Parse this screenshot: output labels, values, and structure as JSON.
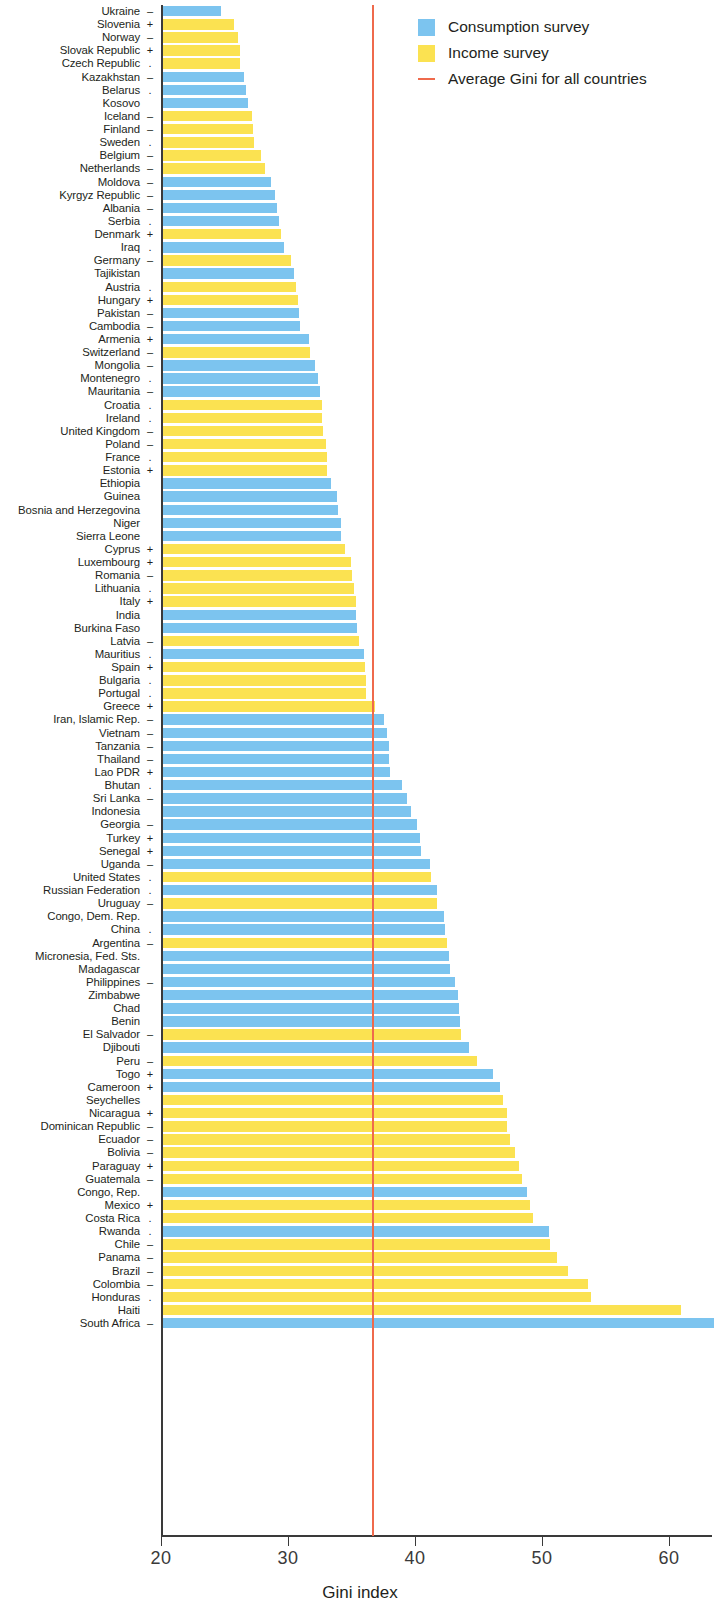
{
  "chart_data": {
    "type": "bar",
    "orientation": "horizontal",
    "title": "",
    "xlabel": "Gini index",
    "ylabel": "",
    "xlim": [
      20,
      64
    ],
    "xticks": [
      20,
      30,
      40,
      50,
      60
    ],
    "grid": false,
    "legend_position": "top-right",
    "legend": [
      {
        "label": "Consumption survey",
        "color": "#7cc4ef",
        "marker": "square"
      },
      {
        "label": "Income survey",
        "color": "#fbe251",
        "marker": "square"
      },
      {
        "label": "Average Gini for all countries",
        "color": "#ef6a4c",
        "marker": "line"
      }
    ],
    "annotations": {
      "average_gini_all_countries": 36.6,
      "average_line_color": "#ef6a4c",
      "trend_symbol_meaning": {
        "+": "increasing",
        "–": "decreasing",
        ".": "no significant trend",
        "": "not available"
      }
    },
    "categories": [
      "Ukraine",
      "Slovenia",
      "Norway",
      "Slovak Republic",
      "Czech Republic",
      "Kazakhstan",
      "Belarus",
      "Kosovo",
      "Iceland",
      "Finland",
      "Sweden",
      "Belgium",
      "Netherlands",
      "Moldova",
      "Kyrgyz Republic",
      "Albania",
      "Serbia",
      "Denmark",
      "Iraq",
      "Germany",
      "Tajikistan",
      "Austria",
      "Hungary",
      "Pakistan",
      "Cambodia",
      "Armenia",
      "Switzerland",
      "Mongolia",
      "Montenegro",
      "Mauritania",
      "Croatia",
      "Ireland",
      "United Kingdom",
      "Poland",
      "France",
      "Estonia",
      "Ethiopia",
      "Guinea",
      "Bosnia and Herzegovina",
      "Niger",
      "Sierra Leone",
      "Cyprus",
      "Luxembourg",
      "Romania",
      "Lithuania",
      "Italy",
      "India",
      "Burkina Faso",
      "Latvia",
      "Mauritius",
      "Spain",
      "Bulgaria",
      "Portugal",
      "Greece",
      "Iran, Islamic Rep.",
      "Vietnam",
      "Tanzania",
      "Thailand",
      "Lao PDR",
      "Bhutan",
      "Sri Lanka",
      "Indonesia",
      "Georgia",
      "Turkey",
      "Senegal",
      "Uganda",
      "United States",
      "Russian Federation",
      "Uruguay",
      "Congo, Dem. Rep.",
      "China",
      "Argentina",
      "Micronesia, Fed. Sts.",
      "Madagascar",
      "Philippines",
      "Zimbabwe",
      "Chad",
      "Benin",
      "El Salvador",
      "Djibouti",
      "Peru",
      "Togo",
      "Cameroon",
      "Seychelles",
      "Nicaragua",
      "Dominican Republic",
      "Ecuador",
      "Bolivia",
      "Paraguay",
      "Guatemala",
      "Congo, Rep.",
      "Mexico",
      "Costa Rica",
      "Rwanda",
      "Chile",
      "Panama",
      "Brazil",
      "Colombia",
      "Honduras",
      "Haiti",
      "South Africa"
    ],
    "values": [
      24.6,
      25.6,
      25.9,
      26.1,
      26.1,
      26.4,
      26.5,
      26.7,
      27.0,
      27.1,
      27.2,
      27.7,
      28.0,
      28.5,
      28.8,
      29.0,
      29.1,
      29.3,
      29.5,
      30.1,
      30.3,
      30.5,
      30.6,
      30.7,
      30.8,
      31.5,
      31.6,
      32.0,
      32.2,
      32.4,
      32.5,
      32.5,
      32.6,
      32.8,
      32.9,
      32.9,
      33.2,
      33.7,
      33.8,
      34.0,
      34.0,
      34.3,
      34.8,
      34.9,
      35.0,
      35.2,
      35.2,
      35.3,
      35.4,
      35.8,
      35.9,
      36.0,
      36.0,
      36.7,
      37.4,
      37.6,
      37.8,
      37.8,
      37.9,
      38.8,
      39.2,
      39.5,
      40.0,
      40.2,
      40.3,
      41.0,
      41.1,
      41.6,
      41.6,
      42.1,
      42.2,
      42.4,
      42.5,
      42.6,
      43.0,
      43.2,
      43.3,
      43.4,
      43.5,
      44.1,
      44.7,
      46.0,
      46.5,
      46.8,
      47.1,
      47.1,
      47.3,
      47.7,
      48.0,
      48.3,
      48.7,
      48.9,
      49.1,
      50.4,
      50.5,
      51.0,
      51.9,
      53.5,
      53.7,
      60.8,
      63.4
    ],
    "bar_types": [
      "consumption",
      "income",
      "income",
      "income",
      "income",
      "consumption",
      "consumption",
      "consumption",
      "income",
      "income",
      "income",
      "income",
      "income",
      "consumption",
      "consumption",
      "consumption",
      "consumption",
      "income",
      "consumption",
      "income",
      "consumption",
      "income",
      "income",
      "consumption",
      "consumption",
      "consumption",
      "income",
      "consumption",
      "consumption",
      "consumption",
      "income",
      "income",
      "income",
      "income",
      "income",
      "income",
      "consumption",
      "consumption",
      "consumption",
      "consumption",
      "consumption",
      "income",
      "income",
      "income",
      "income",
      "income",
      "consumption",
      "consumption",
      "income",
      "consumption",
      "income",
      "income",
      "income",
      "income",
      "consumption",
      "consumption",
      "consumption",
      "consumption",
      "consumption",
      "consumption",
      "consumption",
      "consumption",
      "consumption",
      "consumption",
      "consumption",
      "consumption",
      "income",
      "consumption",
      "income",
      "consumption",
      "consumption",
      "income",
      "consumption",
      "consumption",
      "consumption",
      "consumption",
      "consumption",
      "consumption",
      "income",
      "consumption",
      "income",
      "consumption",
      "consumption",
      "income",
      "income",
      "income",
      "income",
      "income",
      "income",
      "income",
      "consumption",
      "income",
      "income",
      "consumption",
      "income",
      "income",
      "income",
      "income",
      "income",
      "income",
      "consumption"
    ],
    "trend_symbols": [
      "–",
      "+",
      "–",
      "+",
      ".",
      "–",
      ".",
      "",
      "–",
      "–",
      ".",
      "–",
      "–",
      "–",
      "–",
      "–",
      ".",
      "+",
      ".",
      "–",
      "",
      ".",
      "+",
      "–",
      "–",
      "+",
      "–",
      "–",
      ".",
      "–",
      ".",
      ".",
      "–",
      "–",
      ".",
      "+",
      "",
      "",
      "",
      "",
      "",
      "+",
      "+",
      "–",
      ".",
      "+",
      "",
      "",
      "–",
      ".",
      "+",
      ".",
      ".",
      "+",
      "–",
      "–",
      "–",
      "–",
      "+",
      ".",
      "–",
      "",
      "–",
      "+",
      "+",
      "–",
      ".",
      ".",
      "–",
      "",
      ".",
      "–",
      "",
      "",
      "–",
      "",
      "",
      "",
      "–",
      "",
      "–",
      "+",
      "+",
      "",
      "+",
      "–",
      "–",
      "–",
      "+",
      "–",
      "",
      "+",
      ".",
      ".",
      "–",
      "–",
      "–",
      "–",
      ".",
      "",
      "–"
    ]
  }
}
